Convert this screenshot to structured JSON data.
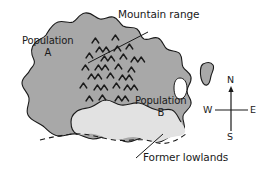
{
  "figure": {
    "kind": "map-diagram",
    "width": 264,
    "height": 173,
    "background_color": "#ffffff"
  },
  "colors": {
    "landmass_fill": "#a8a8a8",
    "lowlands_fill": "#e2e2e2",
    "water_fill": "#ffffff",
    "outline": "#1a1a1a",
    "text": "#1a1a1a"
  },
  "callouts": {
    "mountain_range": {
      "label": "Mountain range",
      "leader": "line from label down-left into mountain symbols"
    },
    "former_lowlands": {
      "label": "Former lowlands",
      "leader": "line from label up-right to dashed lowland boundary"
    }
  },
  "regions": {
    "population_a": {
      "name": "Population",
      "letter": "A"
    },
    "population_b": {
      "name": "Population",
      "letter": "B"
    }
  },
  "compass": {
    "north": "N",
    "south": "S",
    "east": "E",
    "west": "W"
  },
  "symbols": {
    "mountain_symbol": "chevron",
    "mountain_symbol_count": 34,
    "island_count": 1,
    "inlet_count": 1
  }
}
